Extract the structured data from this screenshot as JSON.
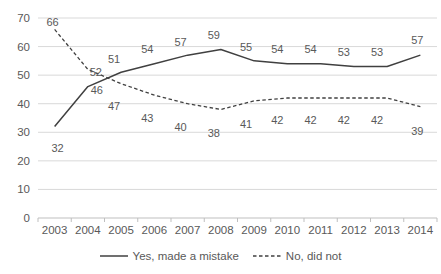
{
  "chart_data": {
    "type": "line",
    "categories": [
      "2003",
      "2004",
      "2005",
      "2006",
      "2007",
      "2008",
      "2009",
      "2010",
      "2011",
      "2012",
      "2013",
      "2014"
    ],
    "series": [
      {
        "name": "Yes, made a mistake",
        "style": "solid",
        "values": [
          32,
          46,
          51,
          54,
          57,
          59,
          55,
          54,
          54,
          53,
          53,
          57
        ]
      },
      {
        "name": "No, did not",
        "style": "dashed",
        "values": [
          66,
          52,
          47,
          43,
          40,
          38,
          41,
          42,
          42,
          42,
          42,
          39
        ]
      }
    ],
    "title": "",
    "xlabel": "",
    "ylabel": "",
    "ylim": [
      0,
      70
    ],
    "yticks": [
      0,
      10,
      20,
      30,
      40,
      50,
      60,
      70
    ],
    "grid": "horizontal",
    "legend_position": "bottom",
    "data_labels": true
  },
  "colors": {
    "line": "#404040",
    "text": "#595959",
    "gridline": "#d9d9d9",
    "axis": "#bfbfbf",
    "background": "#ffffff"
  }
}
